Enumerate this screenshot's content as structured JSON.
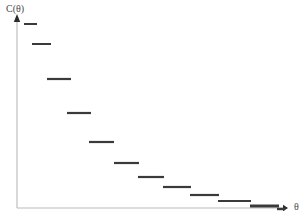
{
  "figure": {
    "width": 306,
    "height": 222,
    "background": "#ffffff"
  },
  "labels": {
    "y_axis": "C(θ)",
    "x_axis": "θ"
  },
  "colors": {
    "axis": "#b9b9b9",
    "arrow": "#2b2b2b",
    "step": "#3a3a3a",
    "label_text": "#4a4a4a"
  },
  "axes": {
    "origin_x": 17,
    "origin_y": 208,
    "y_top": 18,
    "x_right": 283,
    "arrowheads": true,
    "ticks": false,
    "tick_labels": false,
    "grid": false
  },
  "chart_data": {
    "type": "line",
    "subtype": "step",
    "title": "",
    "subtitle": "",
    "xlabel": "θ",
    "ylabel": "C(θ)",
    "xlim": [
      17,
      290
    ],
    "ylim": [
      208,
      18
    ],
    "grid": false,
    "legend": false,
    "series": [
      {
        "name": "C(θ)",
        "color": "#3a3a3a",
        "segments": [
          {
            "index": 1,
            "x_start": 24,
            "x_end": 37,
            "y": 24,
            "thickness": 2.0
          },
          {
            "index": 2,
            "x_start": 32,
            "x_end": 51,
            "y": 44,
            "thickness": 2.0
          },
          {
            "index": 3,
            "x_start": 47,
            "x_end": 71,
            "y": 79,
            "thickness": 2.2
          },
          {
            "index": 4,
            "x_start": 67,
            "x_end": 91,
            "y": 113,
            "thickness": 2.2
          },
          {
            "index": 5,
            "x_start": 89,
            "x_end": 114,
            "y": 142,
            "thickness": 2.2
          },
          {
            "index": 6,
            "x_start": 114,
            "x_end": 139,
            "y": 163,
            "thickness": 2.2
          },
          {
            "index": 7,
            "x_start": 138,
            "x_end": 164,
            "y": 177,
            "thickness": 2.2
          },
          {
            "index": 8,
            "x_start": 163,
            "x_end": 191,
            "y": 187,
            "thickness": 2.2
          },
          {
            "index": 9,
            "x_start": 190,
            "x_end": 219,
            "y": 195,
            "thickness": 2.2
          },
          {
            "index": 10,
            "x_start": 218,
            "x_end": 251,
            "y": 201,
            "thickness": 2.2
          },
          {
            "index": 11,
            "x_start": 250,
            "x_end": 279,
            "y": 206,
            "thickness": 3.0
          },
          {
            "index": 12,
            "x_start": 277,
            "x_end": 285,
            "y": 209,
            "thickness": 2.4
          }
        ]
      }
    ]
  }
}
